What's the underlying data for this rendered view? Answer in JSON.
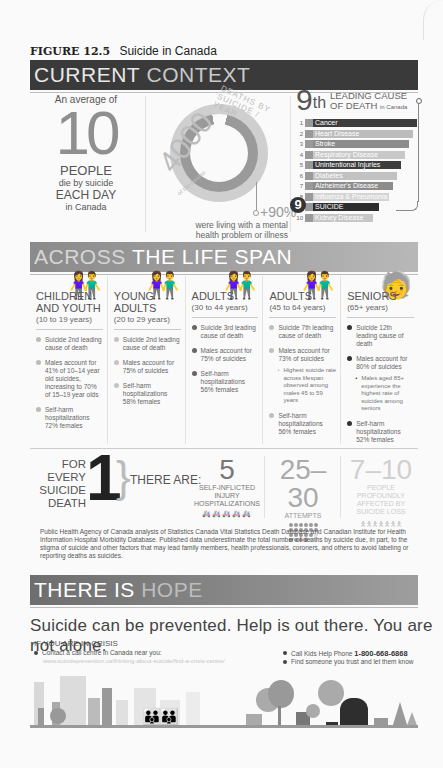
{
  "figure": {
    "number": "FIGURE 12.5",
    "title": "Suicide in Canada"
  },
  "sections": {
    "current_context": {
      "dark": "CURRENT",
      "light": "CONTEXT"
    },
    "life_span": {
      "light": "ACROSS",
      "dark": "THE LIFE SPAN"
    },
    "hope": {
      "dark": "THERE IS",
      "light": "HOPE"
    }
  },
  "current_context": {
    "daily": {
      "intro": "An average of",
      "number": "10",
      "people": "PEOPLE",
      "die": "die by suicide",
      "each_day": "EACH DAY",
      "where": "in Canada"
    },
    "yearly": {
      "number": "4000",
      "arc_text": "DEATHS BY SUICIDE / YEAR",
      "arc_small": "of the deaths",
      "percent": "+90%",
      "note": "were living with a mental health problem or illness",
      "donut_colors": {
        "outer": "#cfcfcf",
        "inner": "#9a9a9a"
      }
    },
    "leading_cause": {
      "rank": "9",
      "rank_suffix": "th",
      "title_line1": "LEADING CAUSE",
      "title_line2": "OF DEATH",
      "title_small": "in Canada",
      "causes": [
        {
          "rank": "1",
          "label": "Cancer",
          "color": "#3d3d3d",
          "width": 104
        },
        {
          "rank": "2",
          "label": "Heart Disease",
          "color": "#bcbcbc",
          "width": 100
        },
        {
          "rank": "3",
          "label": "Stroke",
          "color": "#8c8c8c",
          "width": 96
        },
        {
          "rank": "4",
          "label": "Respiratory Disease",
          "color": "#c8c8c8",
          "width": 92
        },
        {
          "rank": "5",
          "label": "Unintentional Injuries",
          "color": "#3d3d3d",
          "width": 88
        },
        {
          "rank": "6",
          "label": "Diabetes",
          "color": "#c2c2c2",
          "width": 84
        },
        {
          "rank": "7",
          "label": "Alzheimer's Disease",
          "color": "#8c8c8c",
          "width": 80
        },
        {
          "rank": "8",
          "label": "Influenza & Pneumonia",
          "color": "#d4d4d4",
          "width": 76
        },
        {
          "rank": "9",
          "label": "SUICIDE",
          "color": "#2e2e2e",
          "width": 66
        },
        {
          "rank": "10",
          "label": "Kidney Disease",
          "color": "#c6c6c6",
          "width": 60
        }
      ]
    }
  },
  "life_span": {
    "groups": [
      {
        "title": "CHILDREN AND YOUTH",
        "range": "(10 to 19 years)",
        "dot_color": "#bbbbbb",
        "icon_color": "#aaaaaa",
        "items": [
          "Suicide 2nd leading cause of death",
          "Males account for 41% of 10–14 year old suicides, increasing to 70% of 15–19 year olds",
          "Self-harm hospitalizations 72% females"
        ],
        "sub": ""
      },
      {
        "title": "YOUNG ADULTS",
        "range": "(20 to 29 years)",
        "dot_color": "#c4c4c4",
        "icon_color": "#c4c4c4",
        "items": [
          "Suicide 2nd leading cause of death",
          "Males account for 75% of suicides",
          "Self-harm hospitalizations 58% females"
        ],
        "sub": ""
      },
      {
        "title": "ADULTS",
        "range": "(30 to 44 years)",
        "dot_color": "#666666",
        "icon_color": "#666666",
        "items": [
          "Suicide 3rd leading cause of death",
          "Males account for 75% of suicides",
          "Self-harm hospitalizations 56% females"
        ],
        "sub": ""
      },
      {
        "title": "ADULTS",
        "range": "(45 to 64 years)",
        "dot_color": "#c0c0c0",
        "icon_color": "#bdbdbd",
        "items": [
          "Suicide 7th leading cause of death",
          "Males account for 73% of suicides",
          "Self-harm hospitalizations 56% females"
        ],
        "sub": "Highest suicide rate across lifespan observed among males 45 to 59 years"
      },
      {
        "title": "SENIORS",
        "range": "(65+ years)",
        "dot_color": "#333333",
        "icon_color": "#2e2e2e",
        "items": [
          "Suicide 12th leading cause of death",
          "Males account for 80% of suicides",
          "Self-harm hospitalizations 52% females"
        ],
        "sub": "Males aged 85+ experience the highest rate of suicides among seniors"
      }
    ]
  },
  "for_every": {
    "left_text": [
      "FOR EVERY",
      "SUICIDE",
      "DEATH"
    ],
    "number": "1",
    "there_are": "THERE ARE:",
    "stats": [
      {
        "value": "5",
        "label": "SELF-INFLICTED INJURY HOSPITALIZATIONS"
      },
      {
        "value": "25–30",
        "label": "ATTEMPTS"
      },
      {
        "value": "7–10",
        "label": "PEOPLE PROFOUNDLY AFFECTED BY SUICIDE LOSS"
      }
    ]
  },
  "source_note": "Public Health Agency of Canada analysis of Statistics Canada Vital Statistics Death Database and Canadian Institute for Health Information Hospital Morbidity Database. Published data underestimate the total number of deaths by suicide due, in part, to the stigma of suicide and other factors that may lead family members, health professionals, coroners, and others to avoid labeling or reporting deaths as suicides.",
  "hope": {
    "tagline": "Suicide can be prevented. Help is out there. You are not alone.",
    "crisis_heading": "IF YOU ARE IN CRISIS",
    "contact": "Contact a call centre in Canada near you:",
    "url": "www.suicideprevention.ca/thinking-about-suicide/find-a-crisis-centre/",
    "kids_help_label": "Call Kids Help Phone",
    "kids_help_phone": "1-800-668-6868",
    "trust": "Find someone you trust and let them know"
  }
}
